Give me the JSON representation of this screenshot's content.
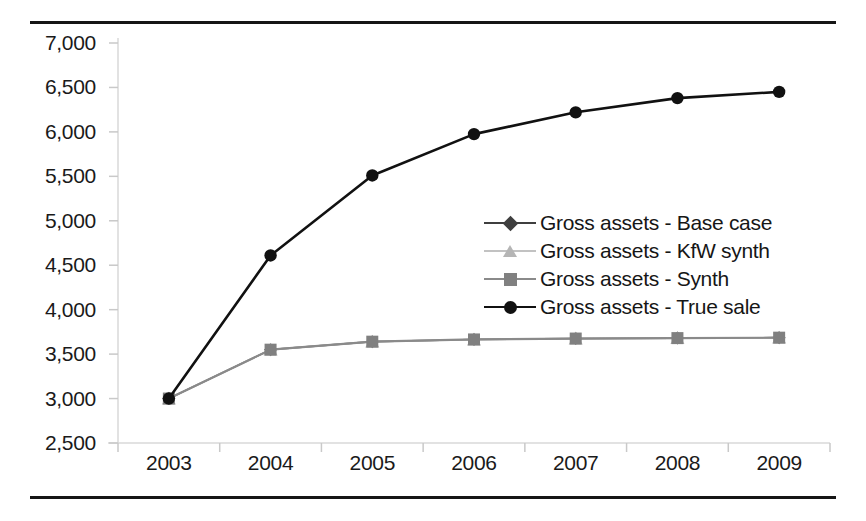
{
  "figure": {
    "background_color": "#ffffff",
    "rule_color": "#161616",
    "has_top_rule": true,
    "has_bottom_rule": true
  },
  "chart_data": {
    "type": "line",
    "title": "",
    "subtitle": "",
    "xlabel": "",
    "ylabel": "",
    "categories": [
      "2003",
      "2004",
      "2005",
      "2006",
      "2007",
      "2008",
      "2009"
    ],
    "x_tick_labels": [
      "2003",
      "2004",
      "2005",
      "2006",
      "2007",
      "2008",
      "2009"
    ],
    "y_tick_labels": [
      "7,000",
      "6,500",
      "6,000",
      "5,500",
      "5,000",
      "4,500",
      "4,000",
      "3,500",
      "3,000",
      "2,500"
    ],
    "y_tick_values": [
      7000,
      6500,
      6000,
      5500,
      5000,
      4500,
      4000,
      3500,
      3000,
      2500
    ],
    "ylim": [
      2500,
      7000
    ],
    "y_tick_step": 500,
    "grid": false,
    "axis_line_color": "#d9d9d9",
    "tick_mark_color": "#c9c9c9",
    "legend_position": "center-right",
    "series": [
      {
        "name": "Gross assets - Base case",
        "marker": "diamond",
        "color": "#3f3f3f",
        "line_color": "#3f3f3f",
        "line_width": 1.6,
        "values": [
          3000,
          3550,
          3640,
          3665,
          3675,
          3680,
          3685
        ]
      },
      {
        "name": "Gross assets - KfW synth",
        "marker": "triangle",
        "color": "#b5b5b5",
        "line_color": "#c2c2c2",
        "line_width": 1.6,
        "values": [
          3000,
          3550,
          3640,
          3665,
          3675,
          3680,
          3685
        ]
      },
      {
        "name": "Gross assets - Synth",
        "marker": "square",
        "color": "#808080",
        "line_color": "#8a8a8a",
        "line_width": 2.2,
        "values": [
          3000,
          3550,
          3640,
          3665,
          3675,
          3680,
          3685
        ]
      },
      {
        "name": "Gross assets - True sale",
        "marker": "circle",
        "color": "#111111",
        "line_color": "#111111",
        "line_width": 2.6,
        "values": [
          3000,
          4610,
          5510,
          5975,
          6220,
          6380,
          6450
        ]
      }
    ]
  },
  "legend": {
    "entries": [
      {
        "label": "Gross assets - Base case",
        "marker": "diamond",
        "color": "#3f3f3f",
        "line_color": "#3f3f3f"
      },
      {
        "label": "Gross assets - KfW synth",
        "marker": "triangle",
        "color": "#b5b5b5",
        "line_color": "#c2c2c2"
      },
      {
        "label": "Gross assets - Synth",
        "marker": "square",
        "color": "#808080",
        "line_color": "#8a8a8a"
      },
      {
        "label": "Gross assets - True sale",
        "marker": "circle",
        "color": "#111111",
        "line_color": "#111111"
      }
    ]
  }
}
